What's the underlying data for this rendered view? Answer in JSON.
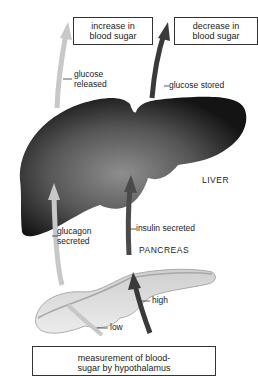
{
  "boxes": {
    "increase": {
      "line1": "increase in",
      "line2": "blood sugar"
    },
    "decrease": {
      "line1": "decrease in",
      "line2": "blood sugar"
    },
    "hypothalamus": {
      "line1": "measurement of blood-",
      "line2": "sugar by hypothalamus"
    }
  },
  "labels": {
    "glucose_released": {
      "line1": "glucose",
      "line2": "released"
    },
    "glucose_stored": "glucose stored",
    "glucagon_secreted": {
      "line1": "glucagon",
      "line2": "secreted"
    },
    "insulin_secreted": "insulin secreted",
    "high": "high",
    "low": "low"
  },
  "organs": {
    "liver": "LIVER",
    "pancreas": "PANCREAS"
  },
  "colors": {
    "light_arrow": "#c8c8c8",
    "dark_arrow": "#3a3a3a",
    "liver_dark": "#1a1a1a",
    "liver_light": "#8a8a8a",
    "pancreas_fill": "#e2e2e2",
    "pancreas_edge": "#9a9a9a"
  }
}
